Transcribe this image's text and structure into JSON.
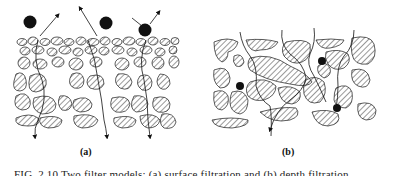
{
  "figure": {
    "panels": [
      {
        "id": "a",
        "label": "(a)",
        "description": "surface filtration: particles retained at top of fine-grained layer"
      },
      {
        "id": "b",
        "label": "(b)",
        "description": "depth filtration: particles captured inside porous medium"
      }
    ],
    "caption": "FIG. 2.10 Two filter models: (a) surface filtration and (b) depth filtration"
  }
}
